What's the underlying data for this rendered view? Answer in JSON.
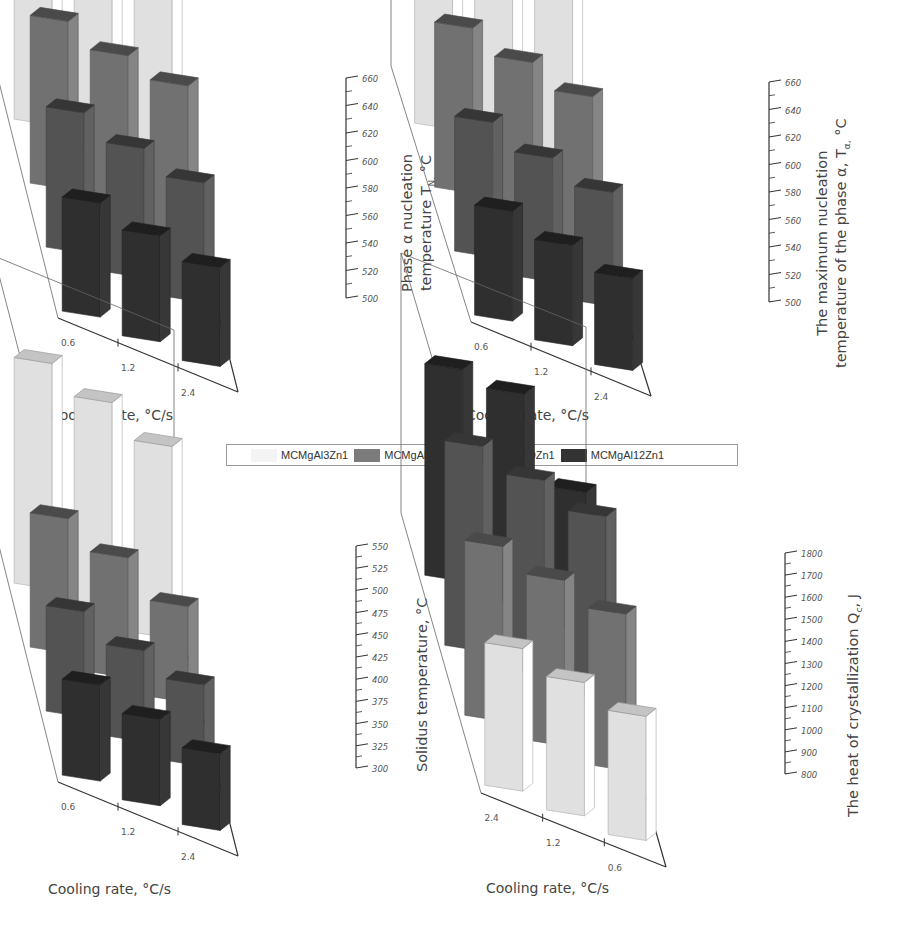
{
  "legend": {
    "items": [
      {
        "label": "MCMgAl3Zn1",
        "color": "#f4f4f4"
      },
      {
        "label": "MCMgAl6Zn1",
        "color": "#7b7b7b"
      },
      {
        "label": "MCMgAl9Zn1",
        "color": "#5a5a5a"
      },
      {
        "label": "MCMgAl12Zn1",
        "color": "#333333"
      }
    ]
  },
  "chart_data": [
    {
      "panel": "(a)",
      "type": "bar",
      "subtype": "3d-bar",
      "xlabel": "Cooling rate, °C/s",
      "ylabel_line1": "Phase α nucleation",
      "ylabel_line2": "temperature T",
      "ylabel_sub": "N,",
      "ylabel_unit": " °C",
      "categories": [
        "0.6",
        "1.2",
        "2.4"
      ],
      "yticks": [
        "500",
        "520",
        "540",
        "560",
        "580",
        "600",
        "620",
        "640",
        "660"
      ],
      "ylim": [
        500,
        660
      ],
      "series": [
        {
          "name": "MCMgAl3Zn1",
          "values": [
            645,
            640,
            636
          ]
        },
        {
          "name": "MCMgAl6Zn1",
          "values": [
            622,
            615,
            611
          ]
        },
        {
          "name": "MCMgAl9Zn1",
          "values": [
            602,
            594,
            587
          ]
        },
        {
          "name": "MCMgAl12Zn1",
          "values": [
            583,
            577,
            572
          ]
        }
      ]
    },
    {
      "panel": "(b)",
      "type": "bar",
      "subtype": "3d-bar",
      "xlabel": "Cooling rate, °C/s",
      "ylabel_line1": "The maximum nucleation",
      "ylabel_line2": "temperature of the phase α, T",
      "ylabel_sub": "α,",
      "ylabel_unit": " °C",
      "categories": [
        "0.6",
        "1.2",
        "2.4"
      ],
      "yticks": [
        "500",
        "520",
        "540",
        "560",
        "580",
        "600",
        "620",
        "640",
        "660"
      ],
      "ylim": [
        500,
        660
      ],
      "series": [
        {
          "name": "MCMgAl3Zn1",
          "values": [
            648,
            642,
            636
          ]
        },
        {
          "name": "MCMgAl6Zn1",
          "values": [
            620,
            613,
            606
          ]
        },
        {
          "name": "MCMgAl9Zn1",
          "values": [
            598,
            590,
            583
          ]
        },
        {
          "name": "MCMgAl12Zn1",
          "values": [
            580,
            573,
            567
          ]
        }
      ]
    },
    {
      "panel": "(c)",
      "type": "bar",
      "subtype": "3d-bar",
      "xlabel": "Cooling rate, °C/s",
      "ylabel_line1": "Solidus temperature, °C",
      "categories": [
        "0.6",
        "1.2",
        "2.4"
      ],
      "yticks": [
        "300",
        "325",
        "350",
        "375",
        "400",
        "425",
        "450",
        "475",
        "500",
        "525",
        "550"
      ],
      "ylim": [
        300,
        550
      ],
      "series": [
        {
          "name": "MCMgAl3Zn1",
          "values": [
            535,
            520,
            500
          ]
        },
        {
          "name": "MCMgAl6Zn1",
          "values": [
            440,
            425,
            400
          ]
        },
        {
          "name": "MCMgAl9Zn1",
          "values": [
            410,
            395,
            385
          ]
        },
        {
          "name": "MCMgAl12Zn1",
          "values": [
            400,
            390,
            380
          ]
        }
      ]
    },
    {
      "panel": "(d)",
      "type": "bar",
      "subtype": "3d-bar",
      "xlabel": "Cooling rate, °C/s",
      "ylabel_line1": "The heat of crystallization Q",
      "ylabel_sub": "c",
      "ylabel_unit": ", J",
      "categories": [
        "2.4",
        "1.2",
        "0.6"
      ],
      "yticks": [
        "800",
        "900",
        "1000",
        "1100",
        "1200",
        "1300",
        "1400",
        "1500",
        "1600",
        "1700",
        "1800"
      ],
      "ylim": [
        800,
        1800
      ],
      "series": [
        {
          "name": "MCMgAl3Zn1",
          "values": [
            1420,
            1380,
            1340
          ]
        },
        {
          "name": "MCMgAl6Zn1",
          "values": [
            1560,
            1520,
            1480
          ]
        },
        {
          "name": "MCMgAl9Zn1",
          "values": [
            1690,
            1650,
            1600
          ]
        },
        {
          "name": "MCMgAl12Zn1",
          "values": [
            1720,
            1720,
            1400
          ]
        }
      ]
    }
  ]
}
